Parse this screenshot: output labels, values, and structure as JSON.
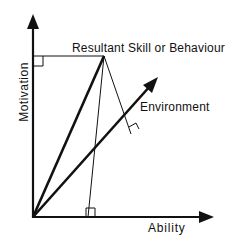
{
  "diagram": {
    "axes": {
      "x_label": "Ability",
      "y_label": "Motivation"
    },
    "labels": {
      "resultant": "Resultant Skill or Behaviour",
      "environment": "Environment"
    },
    "colors": {
      "line": "#111111",
      "background": "#ffffff"
    }
  }
}
